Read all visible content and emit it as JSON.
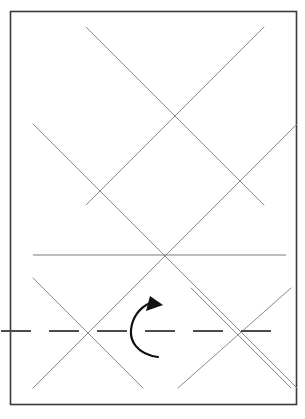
{
  "page": {
    "width": 305,
    "height": 419,
    "background_color": "#ffffff"
  },
  "figure": {
    "name": "diamond-lattice-diagram",
    "stroke_color_frame": "#3a3a3a",
    "stroke_color_diagonal": "#8a8a8a",
    "stroke_color_solid_line": "#7a7a7a",
    "stroke_color_centerline": "#4a4a4a",
    "stroke_color_arrow": "#111111",
    "frame": {
      "name": "border-frame",
      "x": 10.5,
      "y": 11.5,
      "width": 286,
      "height": 393,
      "stroke_width": 1.6
    },
    "diagonals_down_right": [
      {
        "name": "diagonal-dr-1",
        "x1": 86,
        "y1": 27,
        "x2": 264,
        "y2": 205
      },
      {
        "name": "diagonal-dr-2",
        "x1": 33,
        "y1": 124,
        "x2": 297,
        "y2": 388
      },
      {
        "name": "diagonal-dr-3",
        "x1": 33,
        "y1": 278,
        "x2": 143,
        "y2": 388
      },
      {
        "name": "diagonal-dr-4",
        "x1": 191,
        "y1": 288,
        "x2": 291,
        "y2": 388
      }
    ],
    "diagonals_down_left": [
      {
        "name": "diagonal-dl-1",
        "x1": 264,
        "y1": 27,
        "x2": 86,
        "y2": 205
      },
      {
        "name": "diagonal-dl-2",
        "x1": 297,
        "y1": 124,
        "x2": 33,
        "y2": 388
      },
      {
        "name": "diagonal-dl-3",
        "x1": 143,
        "y1": 278,
        "x2": 33,
        "y2": 388
      },
      {
        "name": "diagonal-dl-4",
        "x1": 291,
        "y1": 288,
        "x2": 178,
        "y2": 388
      }
    ],
    "solid_horizontal_line": {
      "name": "horizontal-reference-line",
      "x1": 33,
      "y1": 255,
      "x2": 286,
      "y2": 255,
      "stroke_width": 1.0
    },
    "centerline": {
      "name": "dash-dot-centerline",
      "x1": 1,
      "y1": 331,
      "x2": 288,
      "y2": 331,
      "stroke_width": 1.8,
      "dash_pattern": "30 18"
    },
    "intersections": [
      {
        "name": "node-top-center",
        "x": 160,
        "y": 100
      },
      {
        "name": "node-mid-left",
        "x": 86,
        "y": 178
      },
      {
        "name": "node-mid-right",
        "x": 234,
        "y": 178
      },
      {
        "name": "node-center",
        "x": 160,
        "y": 255
      },
      {
        "name": "node-lower-left",
        "x": 86,
        "y": 331
      },
      {
        "name": "node-lower-right",
        "x": 234,
        "y": 331
      }
    ],
    "rotation_arrow": {
      "name": "rotation-arrow",
      "arc_path": "M 158 357 C 136 354 130 340 131 330 C 132 318 139 308 150 303",
      "head_points": "150,296 163,305 146,311",
      "stroke_width": 2.2,
      "center_x": 148,
      "center_y": 330
    }
  }
}
